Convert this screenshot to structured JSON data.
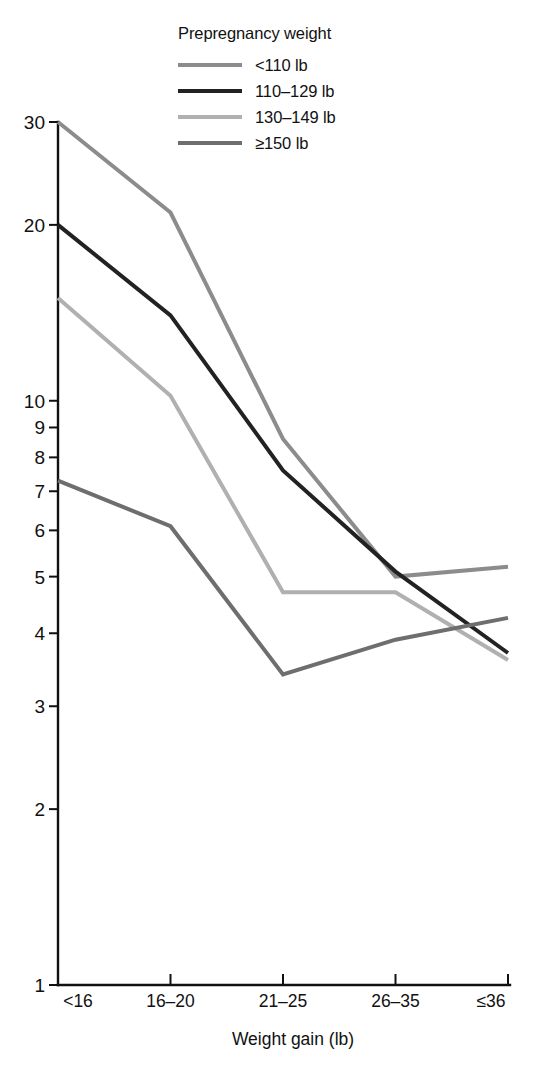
{
  "figure": {
    "background": "#ffffff",
    "legend": {
      "title": "Prepregnancy weight",
      "position": "top-center",
      "entries": [
        {
          "label": "<110 lb",
          "color": "#8c8c8c"
        },
        {
          "label": "110–129 lb",
          "color": "#222222"
        },
        {
          "label": "130–149 lb",
          "color": "#b0b0b0"
        },
        {
          "label": "≥150 lb",
          "color": "#6e6e6e"
        }
      ]
    }
  },
  "chart_data": {
    "type": "line",
    "title": "",
    "subtitle": "",
    "xlabel": "Weight gain (lb)",
    "ylabel": "",
    "categories": [
      "<16",
      "16–20",
      "21–25",
      "26–35",
      "≤36"
    ],
    "x_tick_labels": [
      "<16",
      "16–20",
      "21–25",
      "26–35",
      "≤36"
    ],
    "y_scale": "log",
    "ylim": [
      1,
      32
    ],
    "y_tick_labels": [
      "1",
      "2",
      "3",
      "4",
      "5",
      "6",
      "7",
      "8",
      "9",
      "10",
      "20",
      "30"
    ],
    "y_ticks": [
      1,
      2,
      3,
      4,
      5,
      6,
      7,
      8,
      9,
      10,
      20,
      30
    ],
    "grid": false,
    "legend_position": "top-center",
    "legend_title": "Prepregnancy weight",
    "series": [
      {
        "name": "<110 lb",
        "color": "#8c8c8c",
        "values": [
          30,
          21,
          8.6,
          5.0,
          5.2
        ]
      },
      {
        "name": "110–129 lb",
        "color": "#222222",
        "values": [
          20,
          14,
          7.6,
          5.1,
          3.7
        ]
      },
      {
        "name": "130–149 lb",
        "color": "#b0b0b0",
        "values": [
          15,
          10.2,
          4.7,
          4.7,
          3.6
        ]
      },
      {
        "name": "≥150 lb",
        "color": "#6e6e6e",
        "values": [
          7.3,
          6.1,
          3.4,
          3.9,
          4.25
        ]
      }
    ]
  }
}
